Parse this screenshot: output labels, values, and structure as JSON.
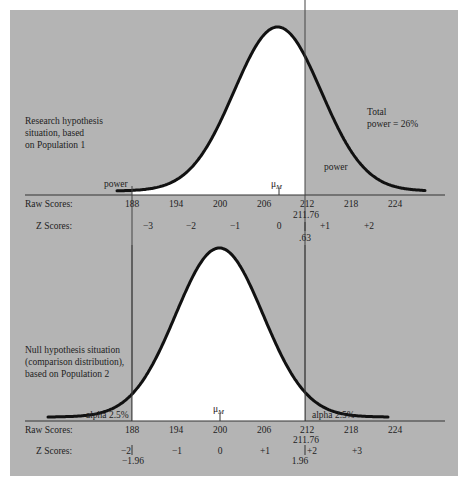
{
  "chart_data": {
    "type": "area",
    "title": "",
    "panels": [
      {
        "name": "research",
        "caption": [
          "Research hypothesis",
          "situation, based",
          "on Population 1"
        ],
        "mean": 208,
        "sd": 6,
        "mean_label": "μ",
        "mean_sub": "M",
        "cutoff_raw": 211.76,
        "cutoff_z": ".63",
        "shaded_left_label": "power",
        "shaded_right_label": "power",
        "total_label": [
          "Total",
          "power = 26%"
        ],
        "raw_ticks": [
          "188",
          "194",
          "200",
          "206",
          "212",
          "218",
          "224"
        ],
        "z_ticks": [
          "−3",
          "−2",
          "−1",
          "0",
          "+1",
          "+2"
        ],
        "raw_label": "Raw Scores:",
        "z_label": "Z Scores:"
      },
      {
        "name": "null",
        "caption": [
          "Null hypothesis situation",
          "(comparison distribution),",
          "based on Population 2"
        ],
        "mean": 200,
        "sd": 6,
        "mean_label": "μ",
        "mean_sub": "M",
        "cutoff_low_raw": 188.24,
        "cutoff_high_raw": 211.76,
        "cutoff_low_z": "−1.96",
        "cutoff_high_z": "1.96",
        "cutoff_high_raw_label": "211.76",
        "alpha_left_label": "alpha 2.5%",
        "alpha_right_label": "alpha 2.5%",
        "raw_ticks": [
          "188",
          "194",
          "200",
          "206",
          "212",
          "218",
          "224"
        ],
        "z_ticks": [
          "−2",
          "−1",
          "0",
          "+1",
          "+2",
          "+3"
        ],
        "raw_label": "Raw Scores:",
        "z_label": "Z Scores:"
      }
    ],
    "xlabel": "Raw Scores / Z Scores",
    "ylabel": "",
    "colors": {
      "background": "#b4b4b4",
      "fill": "#ffffff",
      "curve": "#111111"
    }
  },
  "top": {
    "caption": [
      "Research hypothesis",
      "situation, based",
      "on Population 1"
    ],
    "power_left": "power",
    "power_right": "power",
    "total": [
      "Total",
      "power = 26%"
    ],
    "mu": "μ",
    "mu_sub": "M",
    "raw_label": "Raw Scores:",
    "z_label": "Z Scores:",
    "raw_ticks": [
      "188",
      "194",
      "200",
      "206",
      "212",
      "218",
      "224"
    ],
    "cutoff_raw": "211.76",
    "z_ticks": [
      "−3",
      "−2",
      "−1",
      "0",
      "+1",
      "+2"
    ],
    "cutoff_z": ".63"
  },
  "bottom": {
    "caption": [
      "Null hypothesis situation",
      "(comparison distribution),",
      "based on Population 2"
    ],
    "alpha_left": "alpha 2.5%",
    "alpha_right": "alpha 2.5%",
    "mu": "μ",
    "mu_sub": "M",
    "raw_label": "Raw Scores:",
    "z_label": "Z Scores:",
    "raw_ticks": [
      "188",
      "194",
      "200",
      "206",
      "212",
      "218",
      "224"
    ],
    "cutoff_raw": "211.76",
    "z_ticks": [
      "−2",
      "−1",
      "0",
      "+1",
      "+2",
      "+3"
    ],
    "cutoff_low_z": "−1.96",
    "cutoff_high_z": "1.96"
  }
}
